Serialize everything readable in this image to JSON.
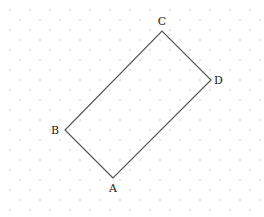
{
  "diagram": {
    "type": "geometry-rectangle-on-dot-grid",
    "colors": {
      "background": "#ffffff",
      "dot": "#b8b8b8",
      "line": "#555555",
      "label": "#222222"
    },
    "grid": {
      "dx": 20,
      "dy": 10,
      "row_offset": 10,
      "x0": 10,
      "y0": 10
    },
    "vertices": [
      {
        "name": "A",
        "label": "A",
        "x": 113,
        "y": 178,
        "lx": 113,
        "ly": 192,
        "anchor": "middle"
      },
      {
        "name": "B",
        "label": "B",
        "x": 65,
        "y": 130,
        "lx": 59,
        "ly": 134,
        "anchor": "end"
      },
      {
        "name": "C",
        "label": "C",
        "x": 162,
        "y": 31,
        "lx": 162,
        "ly": 25,
        "anchor": "middle"
      },
      {
        "name": "D",
        "label": "D",
        "x": 211,
        "y": 80,
        "lx": 214,
        "ly": 84,
        "anchor": "start"
      }
    ],
    "polygon_order": [
      "A",
      "B",
      "C",
      "D"
    ]
  }
}
